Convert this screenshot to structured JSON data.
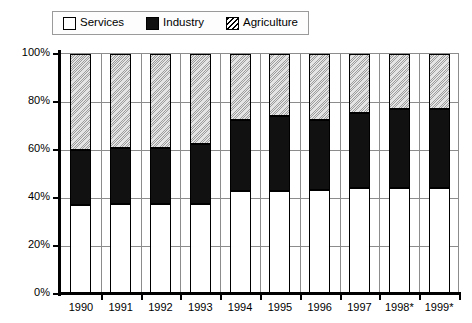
{
  "legend": {
    "position": "top",
    "entries": [
      {
        "label": "Services",
        "icon": "white-square-swatch",
        "color": "#ffffff"
      },
      {
        "label": "Industry",
        "icon": "black-square-swatch",
        "color": "#111111"
      },
      {
        "label": "Agriculture",
        "icon": "hatched-square-swatch",
        "color": "#ffffff"
      }
    ]
  },
  "axes": {
    "y_ticks": [
      "0%",
      "20%",
      "40%",
      "60%",
      "80%",
      "100%"
    ],
    "x_ticks": [
      "1990",
      "1991",
      "1992",
      "1993",
      "1994",
      "1995",
      "1996",
      "1997",
      "1998*",
      "1999*"
    ]
  },
  "chart_data": {
    "type": "bar",
    "stacked": true,
    "title": "",
    "subtitle": "",
    "xlabel": "",
    "ylabel": "",
    "ylim": [
      0,
      100
    ],
    "yunit": "%",
    "grid": true,
    "legend_position": "top",
    "categories": [
      "1990",
      "1991",
      "1992",
      "1993",
      "1994",
      "1995",
      "1996",
      "1997",
      "1998*",
      "1999*"
    ],
    "series": [
      {
        "name": "Services",
        "color": "#ffffff",
        "pattern": "solid-white",
        "values": [
          37,
          37.5,
          37.5,
          37.5,
          43,
          43,
          43.5,
          44,
          44,
          44
        ]
      },
      {
        "name": "Industry",
        "color": "#111111",
        "pattern": "solid-black",
        "values": [
          23,
          23.5,
          23.5,
          25,
          29.5,
          31,
          29,
          31.5,
          33,
          33
        ]
      },
      {
        "name": "Agriculture",
        "color": "#ffffff",
        "pattern": "diagonal-hatch",
        "values": [
          40,
          39,
          39,
          37.5,
          27.5,
          26,
          27.5,
          24.5,
          23,
          23
        ]
      }
    ],
    "cumulative_tops": {
      "services": [
        37,
        37.5,
        37.5,
        37.5,
        43,
        43,
        43.5,
        44,
        44,
        44
      ],
      "services_industry": [
        60,
        61,
        61,
        62.5,
        72.5,
        74,
        72.5,
        75.5,
        77,
        77
      ],
      "total": [
        100,
        100,
        100,
        100,
        100,
        100,
        100,
        100,
        100,
        100
      ]
    }
  }
}
